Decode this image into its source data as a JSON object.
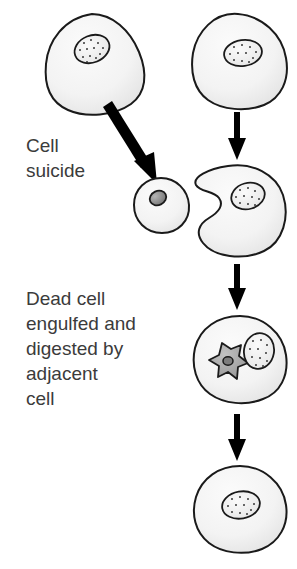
{
  "figure": {
    "kind": "biology-diagram",
    "background_color": "#ffffff"
  },
  "palette": {
    "outline": "#1a1a1a",
    "cell_fill_light": "#f7f7f7",
    "cell_fill_shade": "#e4e4e4",
    "nucleus_fill": "#f2f2f2",
    "nucleus_speckle": "#2b2b2b",
    "condensed_nucleus_fill": "#8d8d8d",
    "remnant_fill": "#a8a8a8",
    "arrow_color": "#000000",
    "text_color": "#3b3b3b"
  },
  "captions": [
    {
      "id": "cell-suicide",
      "text": "Cell\nsuicide",
      "lines": [
        "Cell",
        "suicide"
      ]
    },
    {
      "id": "dead-cell-engulfed",
      "text": "Dead cell\nengulfed and\ndigested by\nadjacent\ncell",
      "lines": [
        "Dead cell",
        "engulfed and",
        "digested by",
        "adjacent",
        "cell"
      ]
    }
  ],
  "cells": [
    {
      "id": "healthy-cell-left",
      "label": "healthy cell (left, triangular)",
      "stage": "normal",
      "nucleus": "speckled-oval",
      "nucleus_count": 1
    },
    {
      "id": "healthy-cell-right",
      "label": "healthy cell (right, rounded)",
      "stage": "normal",
      "nucleus": "speckled-oval",
      "nucleus_count": 1
    },
    {
      "id": "apoptotic-cell",
      "label": "shrunken dying cell with condensed nucleus",
      "stage": "apoptotic",
      "nucleus": "condensed-dark-oval",
      "nucleus_count": 1
    },
    {
      "id": "phagocyte-reaching",
      "label": "neighbour cell reaching around dead cell",
      "stage": "engulfing",
      "nucleus": "speckled-oval",
      "nucleus_count": 1
    },
    {
      "id": "phagocyte-digesting",
      "label": "cell containing engulfed remnant being digested",
      "stage": "digesting",
      "nucleus": "speckled-oval",
      "nucleus_count": 1,
      "inclusion": "star-shaped-remnant"
    },
    {
      "id": "restored-cell",
      "label": "cell after digestion complete",
      "stage": "normal",
      "nucleus": "speckled-oval",
      "nucleus_count": 1
    }
  ],
  "arrows": [
    {
      "id": "arrow-diagonal-suicide",
      "direction": "down-right",
      "from": "healthy-cell-left",
      "to": "apoptotic-cell"
    },
    {
      "id": "arrow-down-1",
      "direction": "down",
      "from": "healthy-cell-right",
      "to": "phagocyte-reaching"
    },
    {
      "id": "arrow-down-2",
      "direction": "down",
      "from": "phagocyte-reaching",
      "to": "phagocyte-digesting"
    },
    {
      "id": "arrow-down-3",
      "direction": "down",
      "from": "phagocyte-digesting",
      "to": "restored-cell"
    }
  ]
}
